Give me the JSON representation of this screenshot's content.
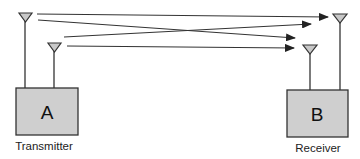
{
  "diagram": {
    "type": "mimo-antenna-link",
    "colors": {
      "box_fill": "#cfcfcf",
      "stroke": "#333333",
      "antenna_fill": "#c8c8c8",
      "background": "#ffffff"
    },
    "transmitter": {
      "box_label": "A",
      "caption": "Transmitter",
      "antennas": 2
    },
    "receiver": {
      "box_label": "B",
      "caption": "Receiver",
      "antennas": 2
    },
    "paths": [
      {
        "from": "tx-antenna-1",
        "to": "rx-antenna-1"
      },
      {
        "from": "tx-antenna-1",
        "to": "rx-antenna-2"
      },
      {
        "from": "tx-antenna-2",
        "to": "rx-antenna-1"
      },
      {
        "from": "tx-antenna-2",
        "to": "rx-antenna-2"
      }
    ]
  }
}
